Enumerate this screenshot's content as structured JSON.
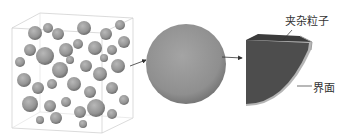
{
  "figure": {
    "panels": [
      {
        "id": "composite",
        "description": "cubic volume with many randomly packed spherical particles"
      },
      {
        "id": "single-particle",
        "description": "single spherical inclusion particle"
      },
      {
        "id": "cut-section",
        "description": "octant cut of particle showing inclusion core and interface layer"
      }
    ],
    "labels": {
      "particle": "夹杂粒子",
      "interface": "界面"
    },
    "colors": {
      "sphere": "#9a9a9a",
      "sphere_dark": "#6e6e6e",
      "core": "#4d4d4d",
      "interface_layer": "#b5b5b5",
      "box_edges": "#c8c8c8",
      "arrow": "#333333"
    }
  }
}
